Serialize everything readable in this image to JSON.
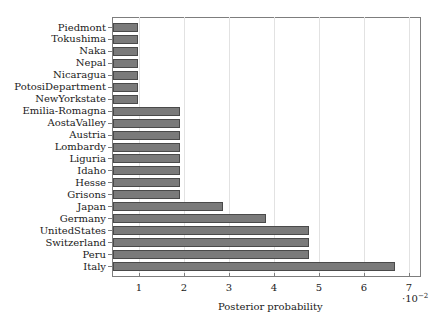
{
  "chart_data": {
    "type": "bar",
    "orientation": "horizontal",
    "title": "",
    "xlabel": "Posterior probability",
    "ylabel": "",
    "x_scale_multiplier": "·10^-2",
    "xlim": [
      0.4,
      7.3
    ],
    "xticks": [
      1,
      2,
      3,
      4,
      5,
      6,
      7
    ],
    "grid": "vertical",
    "legend": null,
    "categories": [
      "Piedmont",
      "Tokushima",
      "Naka",
      "Nepal",
      "Nicaragua",
      "PotosiDepartment",
      "NewYorkstate",
      "Emilia-Romagna",
      "AostaValley",
      "Austria",
      "Lombardy",
      "Liguria",
      "Idaho",
      "Hesse",
      "Grisons",
      "Japan",
      "Germany",
      "UnitedStates",
      "Switzerland",
      "Peru",
      "Italy"
    ],
    "values": [
      0.97,
      0.97,
      0.97,
      0.97,
      0.97,
      0.97,
      0.97,
      1.91,
      1.91,
      1.91,
      1.91,
      1.91,
      1.91,
      1.91,
      1.91,
      2.87,
      3.82,
      4.78,
      4.78,
      4.78,
      6.69
    ],
    "bar_color": "#7a7a7a"
  },
  "labels": {
    "xtitle": "Posterior probability",
    "mult_base": "·10",
    "mult_exp": "−2",
    "xticks": [
      "1",
      "2",
      "3",
      "4",
      "5",
      "6",
      "7"
    ]
  }
}
